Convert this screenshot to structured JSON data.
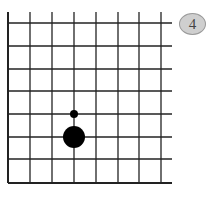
{
  "diagram": {
    "type": "go-board-corner",
    "badge": {
      "label": "4",
      "fill": "#cfcfcf",
      "border": "#9a9a9a"
    },
    "grid": {
      "columns": 8,
      "rows": 8,
      "x_lines": [
        8,
        30,
        52,
        74,
        96,
        118,
        139,
        161
      ],
      "y_lines": [
        23,
        46,
        69,
        91,
        114,
        137,
        159,
        183
      ],
      "right_extent": 172,
      "top_extent": 12,
      "edges": [
        "left",
        "bottom"
      ],
      "line_color": "#222222"
    },
    "stones": [
      {
        "kind": "black",
        "col": 4,
        "row": 6,
        "cx": 74,
        "cy": 137,
        "r": 11,
        "color": "#000000"
      },
      {
        "kind": "marker-dot",
        "col": 4,
        "row": 5,
        "cx": 74,
        "cy": 114,
        "r": 4,
        "color": "#000000"
      }
    ]
  }
}
